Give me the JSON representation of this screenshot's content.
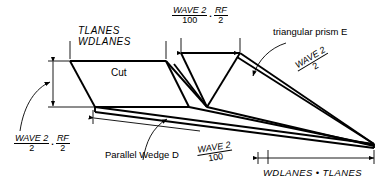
{
  "figure": {
    "title_text": "",
    "background_color": "#ffffff",
    "line_color": "#000000"
  },
  "labels": {
    "top_solid_label_line1": "TLANES",
    "top_solid_label_line2": "WDLANES",
    "cut_label": "Cut",
    "prism_label": "triangular prism E",
    "wedge_label": "Parallel Wedge D",
    "bottom_right_label": "WDLANES • TLANES"
  },
  "expressions": {
    "top_center": {
      "first": {
        "numerator": "WAVE 2",
        "denominator": "100"
      },
      "separator": ".",
      "second": {
        "numerator": "RF",
        "denominator": "2"
      }
    },
    "bottom_left": {
      "first": {
        "numerator": "WAVE 2",
        "denominator": "2"
      },
      "separator": ".",
      "second": {
        "numerator": "RF",
        "denominator": "2"
      }
    },
    "right_slant": {
      "numerator": "WAVE 2",
      "denominator": "2"
    },
    "bottom_slant": {
      "numerator": "WAVE 2",
      "denominator": "100"
    }
  }
}
